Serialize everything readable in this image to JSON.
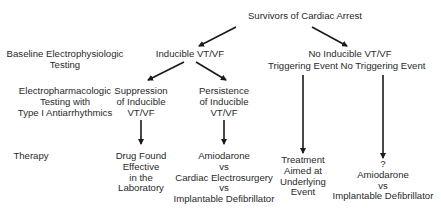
{
  "root": {
    "label": "Survivors of Cardiac Arrest"
  },
  "row_labels": {
    "baseline": [
      "Baseline Electrophysiologic",
      "Testing"
    ],
    "electropharm": [
      "Electropharmacologic",
      "Testing with",
      "Type I Antiarrhythmics"
    ],
    "therapy": [
      "Therapy"
    ]
  },
  "level1": {
    "inducible": "Inducible VT/VF",
    "no_inducible": "No Inducible VT/VF"
  },
  "level2": {
    "suppression": [
      "Suppression",
      "of Inducible",
      "VT/VF"
    ],
    "persistence": [
      "Persistence",
      "of Inducible",
      "VT/VF"
    ],
    "triggering": "Triggering Event",
    "no_triggering": "No Triggering Event"
  },
  "therapy": {
    "drug_found": [
      "Drug Found",
      "Effective",
      "in the",
      "Laboratory"
    ],
    "amiodarone_three": [
      "Amiodarone",
      "vs",
      "Cardiac Electrosurgery",
      "vs",
      "Implantable Defibrillator"
    ],
    "treatment_underlying": [
      "Treatment",
      "Aimed at",
      "Underlying",
      "Event"
    ],
    "amiodarone_two": [
      "?",
      "Amiodarone",
      "vs",
      "Implantable Defibrillator"
    ]
  },
  "colors": {
    "text": "#2a2a2a",
    "arrow": "#1a1a1a",
    "background": "#ffffff"
  }
}
